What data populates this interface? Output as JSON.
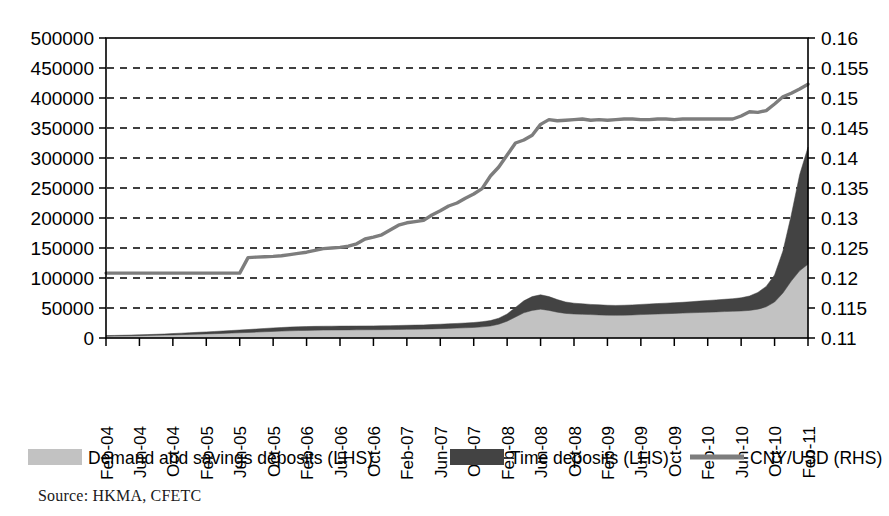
{
  "chart_data": {
    "type": "area",
    "title": "",
    "xlabel": "",
    "ylabel": "",
    "grid": true,
    "legend_position": "bottom",
    "source": "Source: HKMA, CFETC",
    "axes": {
      "left": {
        "label": "",
        "ticks": [
          "0",
          "50000",
          "100000",
          "150000",
          "200000",
          "250000",
          "300000",
          "350000",
          "400000",
          "450000",
          "500000"
        ],
        "min": 0,
        "max": 500000,
        "step": 50000
      },
      "right": {
        "label": "",
        "ticks": [
          "0.11",
          "0.115",
          "0.12",
          "0.125",
          "0.13",
          "0.135",
          "0.14",
          "0.145",
          "0.15",
          "0.155",
          "0.16"
        ],
        "min": 0.11,
        "max": 0.16,
        "step": 0.005
      },
      "x": {
        "tick_labels": [
          "Feb-04",
          "Jun-04",
          "Oct-04",
          "Feb-05",
          "Jun-05",
          "Oct-05",
          "Feb-06",
          "Jun-06",
          "Oct-06",
          "Feb-07",
          "Jun-07",
          "Oct-07",
          "Feb-08",
          "Jun-08",
          "Oct-08",
          "Feb-09",
          "Jun-09",
          "Oct-09",
          "Feb-10",
          "Jun-10",
          "Oct-10",
          "Feb-11"
        ],
        "tick_interval_months": 4,
        "start": "Feb-04",
        "end": "Feb-11"
      }
    },
    "legend": [
      {
        "label": "Demand and savings deposits (LHS)",
        "color": "#c2c2c2",
        "marker": "area"
      },
      {
        "label": "Time deposits (LHS)",
        "color": "#434343",
        "marker": "area"
      },
      {
        "label": "CNY/USD (RHS)",
        "color": "#7d7d7d",
        "marker": "line"
      }
    ],
    "x": [
      "Feb-04",
      "Mar-04",
      "Apr-04",
      "May-04",
      "Jun-04",
      "Jul-04",
      "Aug-04",
      "Sep-04",
      "Oct-04",
      "Nov-04",
      "Dec-04",
      "Jan-05",
      "Feb-05",
      "Mar-05",
      "Apr-05",
      "May-05",
      "Jun-05",
      "Jul-05",
      "Aug-05",
      "Sep-05",
      "Oct-05",
      "Nov-05",
      "Dec-05",
      "Jan-06",
      "Feb-06",
      "Mar-06",
      "Apr-06",
      "May-06",
      "Jun-06",
      "Jul-06",
      "Aug-06",
      "Sep-06",
      "Oct-06",
      "Nov-06",
      "Dec-06",
      "Jan-07",
      "Feb-07",
      "Mar-07",
      "Apr-07",
      "May-07",
      "Jun-07",
      "Jul-07",
      "Aug-07",
      "Sep-07",
      "Oct-07",
      "Nov-07",
      "Dec-07",
      "Jan-08",
      "Feb-08",
      "Mar-08",
      "Apr-08",
      "May-08",
      "Jun-08",
      "Jul-08",
      "Aug-08",
      "Sep-08",
      "Oct-08",
      "Nov-08",
      "Dec-08",
      "Jan-09",
      "Feb-09",
      "Mar-09",
      "Apr-09",
      "May-09",
      "Jun-09",
      "Jul-09",
      "Aug-09",
      "Sep-09",
      "Oct-09",
      "Nov-09",
      "Dec-09",
      "Jan-10",
      "Feb-10",
      "Mar-10",
      "Apr-10",
      "May-10",
      "Jun-10",
      "Jul-10",
      "Aug-10",
      "Sep-10",
      "Oct-10",
      "Nov-10",
      "Dec-10",
      "Jan-11",
      "Feb-11"
    ],
    "series": [
      {
        "name": "Demand and savings deposits (LHS)",
        "axis": "left",
        "stack": "deposits",
        "color": "#c2c2c2",
        "values": [
          3000,
          3200,
          3400,
          3600,
          3900,
          4200,
          4500,
          4800,
          5200,
          5600,
          6000,
          6400,
          6800,
          7200,
          7700,
          8200,
          8700,
          9200,
          9800,
          10400,
          11000,
          11500,
          12000,
          12400,
          12700,
          13000,
          13200,
          13300,
          13400,
          13500,
          13600,
          13700,
          13800,
          13900,
          14000,
          14200,
          14400,
          14600,
          14800,
          15200,
          15600,
          16000,
          16500,
          17000,
          17600,
          18600,
          20000,
          23000,
          28000,
          35000,
          42000,
          46000,
          48000,
          46000,
          43000,
          41000,
          40000,
          39500,
          39000,
          38500,
          38000,
          37800,
          38000,
          38400,
          39000,
          39500,
          40000,
          40500,
          41000,
          41500,
          42000,
          42500,
          43000,
          43500,
          44000,
          44500,
          45000,
          46000,
          48000,
          52000,
          60000,
          75000,
          95000,
          112000,
          123000
        ]
      },
      {
        "name": "Time deposits (LHS)",
        "axis": "left",
        "stack": "deposits",
        "color": "#434343",
        "values": [
          1000,
          1100,
          1200,
          1300,
          1400,
          1500,
          1700,
          1900,
          2200,
          2500,
          2800,
          3100,
          3400,
          3700,
          4000,
          4300,
          4600,
          4900,
          5200,
          5500,
          5800,
          6000,
          6200,
          6300,
          6400,
          6400,
          6400,
          6400,
          6400,
          6400,
          6400,
          6400,
          6400,
          6500,
          6600,
          6700,
          6800,
          6900,
          7000,
          7200,
          7400,
          7600,
          7800,
          8000,
          8200,
          8600,
          9000,
          10000,
          12000,
          16000,
          20000,
          23000,
          24000,
          23000,
          21000,
          19000,
          18000,
          17500,
          17000,
          16800,
          16600,
          16500,
          16600,
          16800,
          17000,
          17200,
          17400,
          17600,
          17800,
          18000,
          18500,
          19000,
          19500,
          20000,
          20500,
          21000,
          22000,
          24000,
          28000,
          34000,
          45000,
          70000,
          110000,
          160000,
          195000
        ]
      },
      {
        "name": "CNY/USD (RHS)",
        "axis": "right",
        "type": "line",
        "color": "#7d7d7d",
        "values": [
          0.12082,
          0.12082,
          0.12082,
          0.12082,
          0.12082,
          0.12082,
          0.12082,
          0.12082,
          0.12082,
          0.12082,
          0.12082,
          0.12082,
          0.12082,
          0.12082,
          0.12082,
          0.12082,
          0.12082,
          0.1234,
          0.12348,
          0.12355,
          0.1236,
          0.1237,
          0.1239,
          0.1241,
          0.1243,
          0.1246,
          0.1249,
          0.125,
          0.1251,
          0.1253,
          0.1257,
          0.1265,
          0.1268,
          0.1272,
          0.128,
          0.1288,
          0.1292,
          0.1294,
          0.1296,
          0.1305,
          0.1312,
          0.132,
          0.1325,
          0.1333,
          0.134,
          0.1349,
          0.137,
          0.1385,
          0.1405,
          0.1425,
          0.143,
          0.1438,
          0.1456,
          0.1464,
          0.1462,
          0.1463,
          0.1464,
          0.1465,
          0.1463,
          0.1464,
          0.1463,
          0.1464,
          0.1465,
          0.1465,
          0.1464,
          0.1464,
          0.1465,
          0.1465,
          0.1464,
          0.1465,
          0.1465,
          0.1465,
          0.1465,
          0.1465,
          0.1465,
          0.1465,
          0.147,
          0.1477,
          0.1476,
          0.1479,
          0.149,
          0.1502,
          0.1508,
          0.1515,
          0.1523
        ]
      }
    ]
  }
}
